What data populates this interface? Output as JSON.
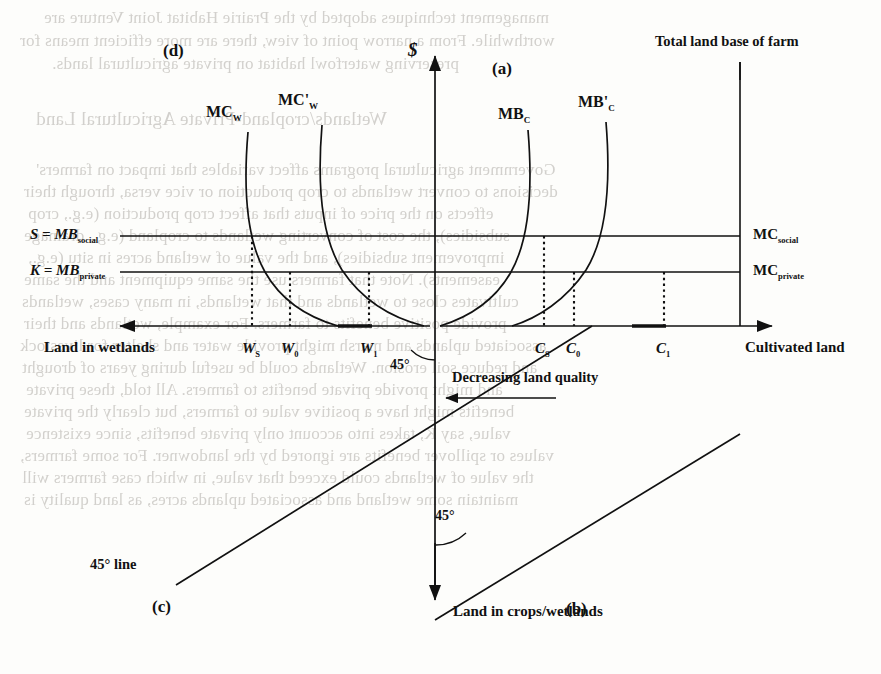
{
  "figure": {
    "type": "four-quadrant-economics-diagram",
    "vertical_axis_label": "$",
    "top_right_note": "Total land base of farm",
    "panels": [
      {
        "id": "a",
        "label": "(a)",
        "quadrant": "top-right"
      },
      {
        "id": "b",
        "label": "(b)",
        "quadrant": "bottom-right"
      },
      {
        "id": "c",
        "label": "(c)",
        "quadrant": "bottom-left"
      },
      {
        "id": "d",
        "label": "(d)",
        "quadrant": "top-left"
      }
    ],
    "axis_labels": {
      "left": "Land in wetlands",
      "right": "Cultivated land",
      "bottom": "Land in crops/wetlands",
      "vertical": "$"
    },
    "horizontal_price_lines": [
      {
        "key": "social",
        "left_label_prefix": "S = MB",
        "left_label_sub": "social",
        "right_label_prefix": "MC",
        "right_label_sub": "social"
      },
      {
        "key": "private",
        "left_label_prefix": "K = MB",
        "left_label_sub": "private",
        "right_label_prefix": "MC",
        "right_label_sub": "private"
      }
    ],
    "curves": [
      {
        "name": "MC",
        "sub": "W",
        "prime": false,
        "side": "left",
        "label": "MC"
      },
      {
        "name": "MC",
        "sub": "W",
        "prime": true,
        "side": "left",
        "label": "MC'"
      },
      {
        "name": "MB",
        "sub": "C",
        "prime": false,
        "side": "right",
        "label": "MB"
      },
      {
        "name": "MB",
        "sub": "C",
        "prime": true,
        "side": "right",
        "label": "MB'"
      }
    ],
    "tick_labels_left": [
      {
        "base": "W",
        "sub": "S"
      },
      {
        "base": "W",
        "sub": "0"
      },
      {
        "base": "W",
        "sub": "1"
      }
    ],
    "tick_labels_right": [
      {
        "base": "C",
        "sub": "S"
      },
      {
        "base": "C",
        "sub": "0"
      },
      {
        "base": "C",
        "sub": "1"
      }
    ],
    "annotations": [
      {
        "text": "Decreasing land quality",
        "kind": "arrow-caption"
      },
      {
        "text": "45° line",
        "kind": "caption"
      },
      {
        "text": "45°",
        "kind": "angle",
        "position": "upper"
      },
      {
        "text": "45°",
        "kind": "angle",
        "position": "lower"
      }
    ],
    "colors": {
      "ink": "#111111",
      "paper": "#fdfdfb",
      "ghost": "#b9b6b1"
    }
  },
  "ghost_text": {
    "lines": [
      {
        "text": "management techniques adopted by the Prairie Habitat Joint Venture are",
        "x": 44,
        "y": 8,
        "size": 17
      },
      {
        "text": "worthwhile. From a narrow point of view, there are more efficient means for",
        "x": 20,
        "y": 31,
        "size": 17
      },
      {
        "text": "preserving waterfowl habitat on private agricultural lands.",
        "x": 52,
        "y": 54,
        "size": 17
      },
      {
        "text": "Wetlands/cropland-Private Agricultural Land",
        "x": 36,
        "y": 108,
        "size": 19
      },
      {
        "text": "Government agricultural programs affect variables that impact on farmers'",
        "x": 36,
        "y": 160,
        "size": 17
      },
      {
        "text": "decisions to convert wetlands to crop production or vice versa, through their",
        "x": 24,
        "y": 182,
        "size": 17
      },
      {
        "text": "effects on the price of inputs that affect crop production (e.g., crop",
        "x": 28,
        "y": 204,
        "size": 17
      },
      {
        "text": "subsidies), the cost of converting wetlands to cropland (e.g., drainage",
        "x": 24,
        "y": 226,
        "size": 17
      },
      {
        "text": "improvement subsidies), and the value of wetland acres in situ (e.g.,",
        "x": 28,
        "y": 248,
        "size": 17
      },
      {
        "text": "easements). Note that farmers use the same equipment and the same",
        "x": 24,
        "y": 270,
        "size": 17
      },
      {
        "text": "cultivates close to wetlands and that wetlands, in many cases, wetlands",
        "x": 22,
        "y": 292,
        "size": 17
      },
      {
        "text": "provide positive benefits to farmers. For example, wetlands and their",
        "x": 24,
        "y": 314,
        "size": 17
      },
      {
        "text": "associated uplands and marsh might provide water and shelter for livestock",
        "x": 20,
        "y": 336,
        "size": 17
      },
      {
        "text": "and reduce soil erosion. Wetlands could be useful during years of drought",
        "x": 22,
        "y": 358,
        "size": 17
      },
      {
        "text": "and might provide private benefits to farmers. All told, these private",
        "x": 26,
        "y": 380,
        "size": 17
      },
      {
        "text": "benefits might have a positive value to farmers, but clearly the private",
        "x": 24,
        "y": 402,
        "size": 17
      },
      {
        "text": "value, say K, takes into account only private benefits, since existence",
        "x": 26,
        "y": 424,
        "size": 17
      },
      {
        "text": "values or spillover benefits are ignored by the landowner. For some farmers,",
        "x": 20,
        "y": 446,
        "size": 17
      },
      {
        "text": "the value of wetlands could exceed that value, in which case farmers will",
        "x": 22,
        "y": 468,
        "size": 17
      },
      {
        "text": "maintain some wetland and associated uplands acres, as land quality is",
        "x": 24,
        "y": 490,
        "size": 17
      }
    ]
  }
}
